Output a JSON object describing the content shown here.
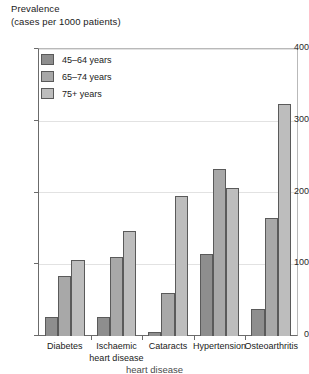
{
  "chart_data": {
    "type": "bar",
    "title": "",
    "ylabel": "Prevalence\n(cases per 1000 patients)",
    "ylabel_line1": "Prevalence",
    "ylabel_line2": "(cases per 1000 patients)",
    "xlabel": "",
    "ylim": [
      0,
      400
    ],
    "yticks": [
      0,
      100,
      200,
      300,
      400
    ],
    "ytick_labels": [
      "0",
      "100",
      "200",
      "300",
      "400"
    ],
    "grid": true,
    "grid_axis": "y",
    "legend_position": "top-left-inside",
    "categories": [
      "Diabetes",
      "Ischaemic heart disease",
      "Cataracts",
      "Hypertension",
      "Osteoarthritis"
    ],
    "category_labels": [
      "Diabetes",
      "Ischaemic\nheart disease",
      "Cataracts",
      "Hypertension",
      "Osteoarthritis"
    ],
    "series": [
      {
        "name": "45–64 years",
        "color": "#8e8e8e",
        "values": [
          26,
          27,
          5,
          115,
          38
        ]
      },
      {
        "name": "65–74 years",
        "color": "#a8a8a8",
        "values": [
          84,
          110,
          60,
          233,
          165
        ]
      },
      {
        "name": "75+ years",
        "color": "#bdbdbd",
        "values": [
          107,
          147,
          196,
          207,
          325
        ]
      }
    ]
  },
  "caption": {
    "text": "heart disease"
  }
}
